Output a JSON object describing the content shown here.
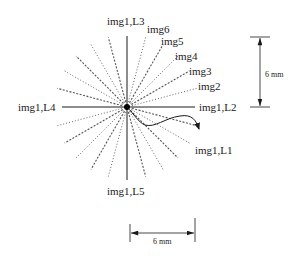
{
  "diagram": {
    "center_label_marker": "image center",
    "radial_lines": {
      "solid_axes": [
        "img1,L1",
        "img1,L2",
        "img1,L3",
        "img1,L4",
        "img1,L5"
      ],
      "angle_step_deg": 15,
      "pattern": [
        "dotted",
        "dashed"
      ]
    },
    "labels": {
      "l3": "img1,L3",
      "l4": "img1,L4",
      "l2": "img1,L2",
      "l5": "img1,L5",
      "l1": "img1,L1",
      "img2": "img2",
      "img3": "img3",
      "img4": "img4",
      "img5": "img5",
      "img6": "img6"
    },
    "dimensions": {
      "vertical": "6 mm",
      "horizontal": "6 mm"
    },
    "colors": {
      "line": "#1a1a1a",
      "dotted": "#555555"
    }
  }
}
